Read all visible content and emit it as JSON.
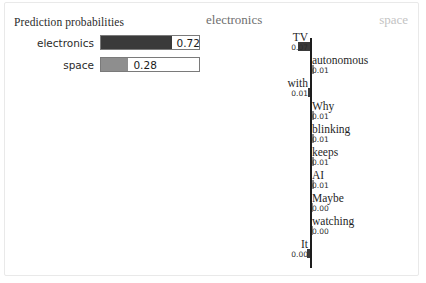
{
  "panel": {
    "probabilities_title": "Prediction probabilities",
    "classes": [
      {
        "label": "electronics",
        "value": "0.72",
        "fraction": 0.72,
        "color": "#3a3a3a"
      },
      {
        "label": "space",
        "value": "0.28",
        "fraction": 0.28,
        "color": "#8e8e8e"
      }
    ]
  },
  "headers": {
    "left_class": "electronics",
    "right_class": "space"
  },
  "chart_data": {
    "type": "bar",
    "orientation": "horizontal-diverging",
    "title": "",
    "xlabel": "",
    "ylabel": "",
    "left_class": "electronics",
    "right_class": "space",
    "grid": false,
    "legend": "top",
    "categories": [
      "TV",
      "autonomous",
      "with",
      "Why",
      "blinking",
      "keeps",
      "AI",
      "Maybe",
      "watching",
      "It"
    ],
    "values": [
      -0.07,
      0.01,
      -0.01,
      0.01,
      0.01,
      0.01,
      0.01,
      0.0,
      0.0,
      -0.0
    ],
    "labels": [
      "0.07",
      "0.01",
      "0.01",
      "0.01",
      "0.01",
      "0.01",
      "0.01",
      "0.00",
      "0.00",
      "0.00"
    ],
    "sides": [
      "left",
      "right",
      "left",
      "right",
      "right",
      "right",
      "right",
      "right",
      "right",
      "left"
    ],
    "bar_px": [
      12,
      2,
      2,
      2,
      2,
      2,
      2,
      1,
      1,
      3
    ],
    "rows": [
      {
        "word": "TV",
        "value": "0.07",
        "side": "left",
        "bar_px": 12
      },
      {
        "word": "autonomous",
        "value": "0.01",
        "side": "right",
        "bar_px": 2
      },
      {
        "word": "with",
        "value": "0.01",
        "side": "left",
        "bar_px": 2
      },
      {
        "word": "Why",
        "value": "0.01",
        "side": "right",
        "bar_px": 2
      },
      {
        "word": "blinking",
        "value": "0.01",
        "side": "right",
        "bar_px": 2
      },
      {
        "word": "keeps",
        "value": "0.01",
        "side": "right",
        "bar_px": 2
      },
      {
        "word": "AI",
        "value": "0.01",
        "side": "right",
        "bar_px": 2
      },
      {
        "word": "Maybe",
        "value": "0.00",
        "side": "right",
        "bar_px": 1
      },
      {
        "word": "watching",
        "value": "0.00",
        "side": "right",
        "bar_px": 1
      },
      {
        "word": "It",
        "value": "0.00",
        "side": "left",
        "bar_px": 3
      }
    ]
  },
  "colors": {
    "negative_bar": "#3a3a3a",
    "positive_bar": "#8e8e8e",
    "axis": "#1d1d1d",
    "frame": "#e9e9e9"
  }
}
